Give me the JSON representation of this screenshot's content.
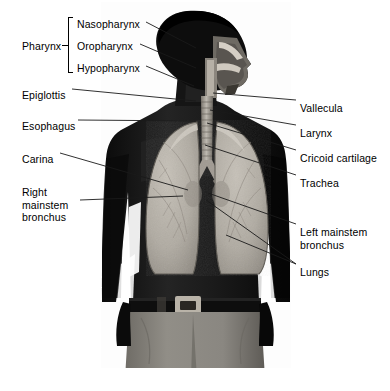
{
  "figure": {
    "type": "anatomical-illustration",
    "background_color": "#ffffff",
    "text_color": "#000000",
    "leader_line_color": "#1a1a1a"
  },
  "labels_left": [
    {
      "id": "pharynx",
      "text": "Pharynx",
      "x": 22,
      "y": 40,
      "has_bracket": true
    },
    {
      "id": "nasopharynx",
      "text": "Nasopharynx",
      "x": 77,
      "y": 18,
      "has_bracket": false
    },
    {
      "id": "oropharynx",
      "text": "Oropharynx",
      "x": 77,
      "y": 40,
      "has_bracket": false
    },
    {
      "id": "hypopharynx",
      "text": "Hypopharynx",
      "x": 77,
      "y": 62,
      "has_bracket": false
    },
    {
      "id": "epiglottis",
      "text": "Epiglottis",
      "x": 22,
      "y": 89,
      "has_bracket": false
    },
    {
      "id": "esophagus",
      "text": "Esophagus",
      "x": 22,
      "y": 120,
      "has_bracket": false
    },
    {
      "id": "carina",
      "text": "Carina",
      "x": 22,
      "y": 153,
      "has_bracket": false
    },
    {
      "id": "right-mainstem-bronchus",
      "text": "Right\nmainstem\nbronchus",
      "x": 22,
      "y": 186,
      "has_bracket": false
    }
  ],
  "labels_right": [
    {
      "id": "vallecula",
      "text": "Vallecula",
      "x": 300,
      "y": 102
    },
    {
      "id": "larynx",
      "text": "Larynx",
      "x": 300,
      "y": 127
    },
    {
      "id": "cricoid-cartilage",
      "text": "Cricoid cartilage",
      "x": 300,
      "y": 152
    },
    {
      "id": "trachea",
      "text": "Trachea",
      "x": 300,
      "y": 177
    },
    {
      "id": "left-mainstem-bronchus",
      "text": "Left mainstem\nbronchus",
      "x": 300,
      "y": 226
    },
    {
      "id": "lungs",
      "text": "Lungs",
      "x": 300,
      "y": 266
    }
  ],
  "bracket": {
    "name": "pharynx-bracket",
    "x": 68,
    "y": 17,
    "height": 56,
    "groups": [
      "Nasopharynx",
      "Oropharynx",
      "Hypopharynx"
    ]
  },
  "leaders": [
    {
      "for": "nasopharynx",
      "x1": 146,
      "y1": 22,
      "x2": 196,
      "y2": 48
    },
    {
      "for": "oropharynx",
      "x1": 140,
      "y1": 44,
      "x2": 196,
      "y2": 68
    },
    {
      "for": "hypopharynx",
      "x1": 146,
      "y1": 66,
      "x2": 194,
      "y2": 86
    },
    {
      "for": "epiglottis",
      "x1": 72,
      "y1": 89,
      "x2": 196,
      "y2": 101
    },
    {
      "for": "esophagus",
      "x1": 78,
      "y1": 120,
      "x2": 196,
      "y2": 121
    },
    {
      "for": "carina",
      "x1": 60,
      "y1": 153,
      "x2": 188,
      "y2": 190
    },
    {
      "for": "right-mainstem-bronchus",
      "x1": 80,
      "y1": 200,
      "x2": 183,
      "y2": 196
    },
    {
      "for": "vallecula",
      "x1": 296,
      "y1": 100,
      "x2": 213,
      "y2": 93
    },
    {
      "for": "larynx",
      "x1": 296,
      "y1": 125,
      "x2": 210,
      "y2": 110
    },
    {
      "for": "cricoid-cartilage",
      "x1": 296,
      "y1": 150,
      "x2": 207,
      "y2": 123
    },
    {
      "for": "trachea",
      "x1": 296,
      "y1": 175,
      "x2": 205,
      "y2": 145
    },
    {
      "for": "left-mainstem-bronchus",
      "x1": 296,
      "y1": 224,
      "x2": 208,
      "y2": 193
    },
    {
      "for": "lungs-upper",
      "x1": 296,
      "y1": 264,
      "x2": 206,
      "y2": 200
    },
    {
      "for": "lungs-lower",
      "x1": 296,
      "y1": 264,
      "x2": 226,
      "y2": 235
    }
  ],
  "anatomy_parts": [
    {
      "id": "head",
      "name": "head-profile-silhouette",
      "tone": "#0d0d0d"
    },
    {
      "id": "face",
      "name": "facial-cutaway",
      "tone": "#6e6a63"
    },
    {
      "id": "airway",
      "name": "upper-airway-lumen",
      "tone": "#cfc9bf"
    },
    {
      "id": "torso",
      "name": "torso-silhouette",
      "tone": "#1b1b1b"
    },
    {
      "id": "trachea",
      "name": "trachea",
      "tone": "#a7a199"
    },
    {
      "id": "lung-r",
      "name": "right-lung",
      "tone": "#b4afa6"
    },
    {
      "id": "lung-l",
      "name": "left-lung",
      "tone": "#b4afa6"
    },
    {
      "id": "belt",
      "name": "belt",
      "tone": "#0e0e0e"
    },
    {
      "id": "buckle",
      "name": "belt-buckle",
      "tone": "#b9b3a8"
    },
    {
      "id": "pants",
      "name": "trousers",
      "tone": "#8d8a84"
    }
  ]
}
